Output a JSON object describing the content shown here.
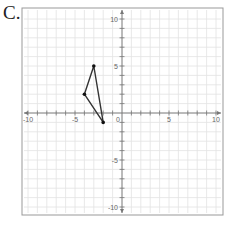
{
  "problem_label": "C.",
  "chart_data": {
    "type": "line",
    "title": "",
    "xlabel": "",
    "ylabel": "",
    "xlim": [
      -10,
      10
    ],
    "ylim": [
      -10,
      10
    ],
    "grid": true,
    "x_tick_labels": [
      "-10",
      "-5",
      "0",
      "5",
      "10"
    ],
    "y_tick_labels": [
      "10",
      "5",
      "-5",
      "-10"
    ],
    "origin_label": "0",
    "shape": "triangle",
    "points": [
      {
        "x": -3,
        "y": 5
      },
      {
        "x": -4,
        "y": 2
      },
      {
        "x": -2,
        "y": -1
      }
    ],
    "line_color": "#333333"
  }
}
